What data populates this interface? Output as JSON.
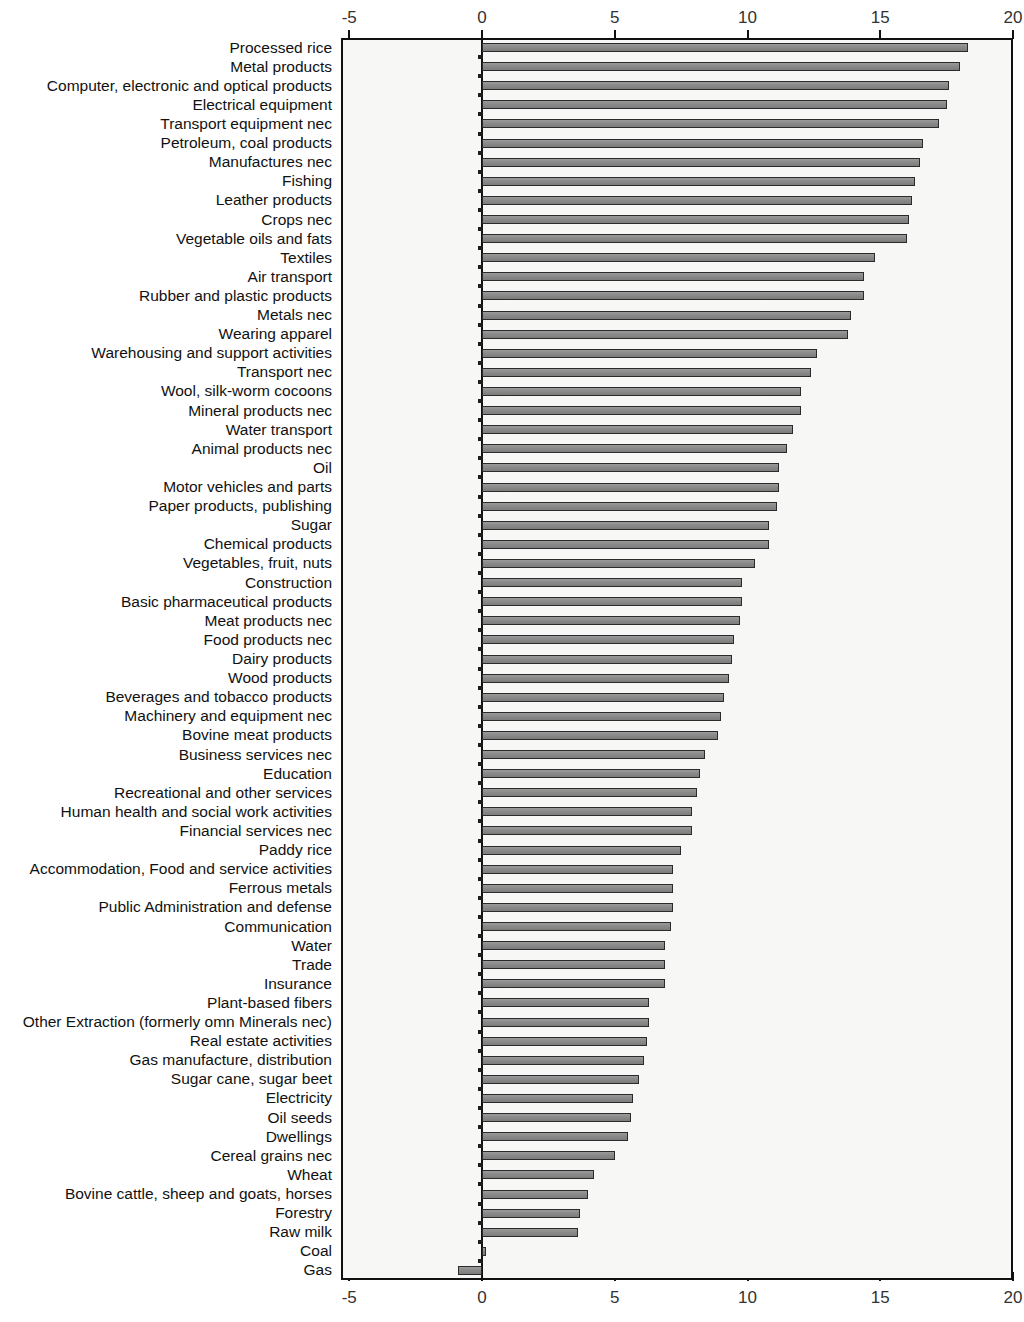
{
  "chart_data": {
    "type": "bar",
    "orientation": "horizontal",
    "title": "",
    "subtitle": "",
    "xlabel": "",
    "ylabel": "",
    "xlim": [
      -5,
      20
    ],
    "ylim": null,
    "grid": false,
    "legend": null,
    "x_ticks": [
      -5,
      0,
      5,
      10,
      15,
      20
    ],
    "x_tick_labels": [
      "-5",
      "0",
      "5",
      "10",
      "15",
      "20"
    ],
    "axis_positions": "top and bottom",
    "bar_color": "#8a8a8a",
    "bar_edge_color": "#2b2b2b",
    "plot_background": "#f7f7f5",
    "categories": [
      "Processed rice",
      "Metal products",
      "Computer, electronic and optical products",
      "Electrical equipment",
      "Transport equipment nec",
      "Petroleum, coal products",
      "Manufactures nec",
      "Fishing",
      "Leather products",
      "Crops nec",
      "Vegetable oils and fats",
      "Textiles",
      "Air transport",
      "Rubber and plastic products",
      "Metals nec",
      "Wearing apparel",
      "Warehousing and support activities",
      "Transport nec",
      "Wool, silk-worm cocoons",
      "Mineral products nec",
      "Water transport",
      "Animal products nec",
      "Oil",
      "Motor vehicles and parts",
      "Paper products, publishing",
      "Sugar",
      "Chemical products",
      "Vegetables, fruit, nuts",
      "Construction",
      "Basic pharmaceutical products",
      "Meat products nec",
      "Food products nec",
      "Dairy products",
      "Wood products",
      "Beverages and tobacco products",
      "Machinery and equipment nec",
      "Bovine meat products",
      "Business services nec",
      "Education",
      "Recreational and other services",
      "Human health and social work activities",
      "Financial services nec",
      "Paddy rice",
      "Accommodation, Food and service activities",
      "Ferrous metals",
      "Public Administration and defense",
      "Communication",
      "Water",
      "Trade",
      "Insurance",
      "Plant-based fibers",
      "Other Extraction (formerly omn Minerals nec)",
      "Real estate activities",
      "Gas manufacture, distribution",
      "Sugar cane, sugar beet",
      "Electricity",
      "Oil seeds",
      "Dwellings",
      "Cereal grains nec",
      "Wheat",
      "Bovine cattle, sheep and goats, horses",
      "Forestry",
      "Raw milk",
      "Coal",
      "Gas"
    ],
    "values": [
      18.3,
      18.0,
      17.6,
      17.5,
      17.2,
      16.6,
      16.5,
      16.3,
      16.2,
      16.1,
      16.0,
      14.8,
      14.4,
      14.4,
      13.9,
      13.8,
      12.6,
      12.4,
      12.0,
      12.0,
      11.7,
      11.5,
      11.2,
      11.2,
      11.1,
      10.8,
      10.8,
      10.3,
      9.8,
      9.8,
      9.7,
      9.5,
      9.4,
      9.3,
      9.1,
      9.0,
      8.9,
      8.4,
      8.2,
      8.1,
      7.9,
      7.9,
      7.5,
      7.2,
      7.2,
      7.2,
      7.1,
      6.9,
      6.9,
      6.9,
      6.3,
      6.3,
      6.2,
      6.1,
      5.9,
      5.7,
      5.6,
      5.5,
      5.0,
      4.2,
      4.0,
      3.7,
      3.6,
      0.15,
      -0.9
    ]
  }
}
